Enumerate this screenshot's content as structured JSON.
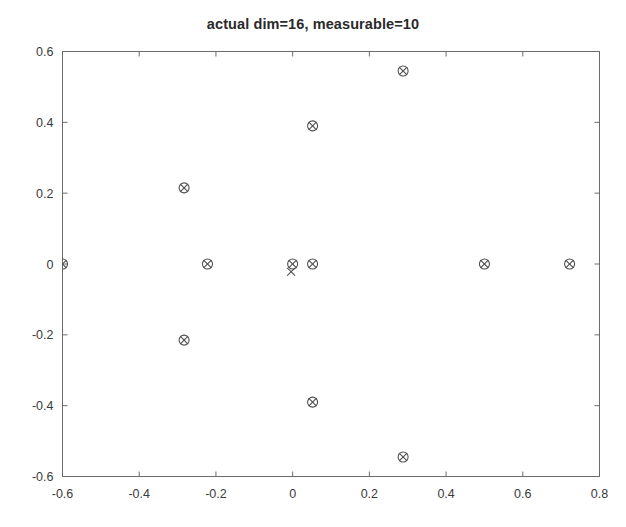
{
  "chart_data": {
    "type": "scatter",
    "title": "actual dim=16,  measurable=10",
    "xlabel": "",
    "ylabel": "",
    "xlim": [
      -0.6,
      0.8
    ],
    "ylim": [
      -0.6,
      0.6
    ],
    "xticks": [
      "-0.6",
      "-0.4",
      "-0.2",
      "0",
      "0.2",
      "0.4",
      "0.6",
      "0.8"
    ],
    "xtick_values": [
      -0.6,
      -0.4,
      -0.2,
      0,
      0.2,
      0.4,
      0.6,
      0.8
    ],
    "yticks": [
      "0.6",
      "0.4",
      "0.2",
      "0",
      "-0.2",
      "-0.4",
      "-0.6"
    ],
    "ytick_values": [
      0.6,
      0.4,
      0.2,
      0,
      -0.2,
      -0.4,
      -0.6
    ],
    "grid": false,
    "legend": null,
    "marker_style": "circle-x",
    "series": [
      {
        "name": "eigenvalues",
        "marker": "circle-x",
        "points": [
          {
            "x": -0.6,
            "y": 0.0
          },
          {
            "x": -0.283,
            "y": 0.215
          },
          {
            "x": -0.222,
            "y": 0.0
          },
          {
            "x": -0.283,
            "y": -0.215
          },
          {
            "x": 0.0,
            "y": 0.0
          },
          {
            "x": 0.052,
            "y": 0.0
          },
          {
            "x": 0.052,
            "y": 0.39
          },
          {
            "x": 0.052,
            "y": -0.39
          },
          {
            "x": 0.288,
            "y": 0.545
          },
          {
            "x": 0.288,
            "y": -0.545
          },
          {
            "x": 0.5,
            "y": 0.0
          },
          {
            "x": 0.722,
            "y": 0.0
          }
        ]
      },
      {
        "name": "estimated",
        "marker": "x",
        "points": [
          {
            "x": -0.004,
            "y": -0.022
          }
        ]
      }
    ]
  },
  "figure": {
    "background_color": "#ffffff",
    "axis_color": "#6b6b6b",
    "marker_color": "#4a4a4a",
    "title_color": "#2a2a2a"
  }
}
